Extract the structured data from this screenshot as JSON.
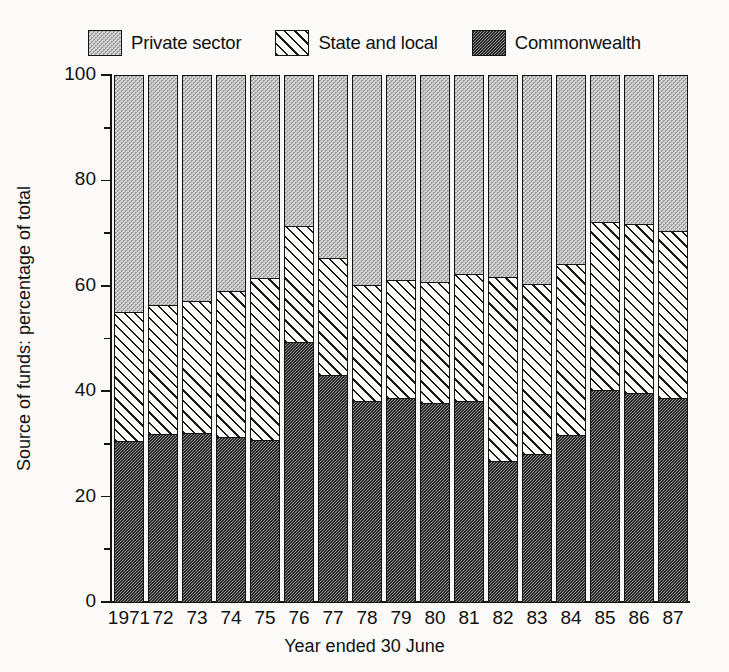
{
  "chart_data": {
    "type": "bar",
    "subtype": "stacked-percentage",
    "title": "",
    "xlabel": "Year ended 30 June",
    "ylabel": "Source of funds: percentage of total",
    "ylim": [
      0,
      100
    ],
    "ytick_values": [
      0,
      20,
      40,
      60,
      80,
      100
    ],
    "ytick_labels": [
      "0",
      "20",
      "40",
      "60",
      "80",
      "100"
    ],
    "yminor_ticks": [
      10,
      30,
      50,
      70,
      90
    ],
    "grid": false,
    "legend_position": "top",
    "categories": [
      "1971",
      "72",
      "73",
      "74",
      "75",
      "76",
      "77",
      "78",
      "79",
      "80",
      "81",
      "82",
      "83",
      "84",
      "85",
      "86",
      "87"
    ],
    "series": [
      {
        "name": "Commonwealth",
        "pattern": "dense-checker-dark-grey",
        "values": [
          30.5,
          31.8,
          31.9,
          31.2,
          30.6,
          49.3,
          43.0,
          38.0,
          38.6,
          37.7,
          38.0,
          26.6,
          27.9,
          31.6,
          40.2,
          39.5,
          38.6
        ]
      },
      {
        "name": "State and local",
        "pattern": "diagonal-hatch",
        "values": [
          24.5,
          24.4,
          25.1,
          27.7,
          30.8,
          22.0,
          22.2,
          22.0,
          22.4,
          22.9,
          24.2,
          35.0,
          32.4,
          32.4,
          31.8,
          32.2,
          31.8
        ]
      },
      {
        "name": "Private sector",
        "pattern": "light-stipple-grey",
        "values": [
          45.0,
          43.8,
          43.0,
          41.1,
          38.6,
          28.7,
          34.8,
          40.0,
          39.0,
          39.4,
          37.8,
          38.4,
          39.7,
          36.0,
          28.0,
          28.3,
          29.6
        ]
      }
    ],
    "stack_tops": {
      "commonwealth": [
        30.5,
        31.8,
        31.9,
        31.2,
        30.6,
        49.3,
        43.0,
        38.0,
        38.6,
        37.7,
        38.0,
        26.6,
        27.9,
        31.6,
        40.2,
        39.5,
        38.6
      ],
      "commonwealth_plus_state": [
        55.0,
        56.2,
        57.0,
        58.9,
        61.4,
        71.3,
        65.2,
        60.0,
        61.0,
        60.6,
        62.2,
        61.6,
        60.3,
        64.0,
        72.0,
        71.7,
        70.4
      ]
    }
  },
  "legend": {
    "items": [
      {
        "label": "Private sector",
        "pattern_class": "pat-private",
        "icon": "swatch-stipple-light"
      },
      {
        "label": "State and local",
        "pattern_class": "pat-state",
        "icon": "swatch-diagonal-hatch"
      },
      {
        "label": "Commonwealth",
        "pattern_class": "pat-commonwealth",
        "icon": "swatch-checker-dark"
      }
    ]
  },
  "axes": {
    "y_title": "Source of funds: percentage of total",
    "x_title": "Year ended 30 June"
  }
}
